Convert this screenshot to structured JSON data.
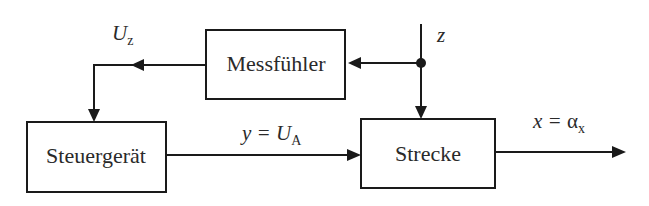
{
  "diagram": {
    "type": "block-diagram",
    "blocks": {
      "sensor": {
        "label": "Messfühler"
      },
      "controller": {
        "label": "Steuergerät"
      },
      "plant": {
        "label": "Strecke"
      }
    },
    "signals": {
      "disturbance": {
        "symbol": "z"
      },
      "sensor_output": {
        "symbol": "U",
        "subscript": "z"
      },
      "control_output": {
        "prefix": "y = ",
        "symbol": "U",
        "subscript": "A"
      },
      "plant_output": {
        "prefix": "x = ",
        "symbol": "α",
        "subscript": "x"
      }
    },
    "colors": {
      "line": "#1a1a1a",
      "text": "#2a2a2a",
      "background": "#ffffff"
    }
  }
}
